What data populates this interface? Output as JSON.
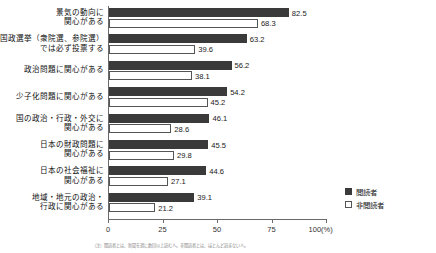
{
  "chart_data": {
    "type": "bar",
    "orientation": "horizontal",
    "title": "",
    "xlabel": "",
    "ylabel": "",
    "xlim": [
      0,
      100
    ],
    "xticks": [
      0,
      25,
      50,
      75,
      100
    ],
    "xtick_labels": [
      "0",
      "25",
      "50",
      "75",
      "100(%)"
    ],
    "grid": false,
    "legend_position": "bottom-right",
    "categories": [
      "景気の動向に\n関心がある",
      "国政選挙（衆院選、参院選）\nでは必ず投票する",
      "政治問題に関心がある",
      "少子化問題に関心がある",
      "国の政治・行政・外交に\n関心がある",
      "日本の財政問題に\n関心がある",
      "日本の社会福祉に\n関心がある",
      "地域・地元の政治・\n行政に関心がある"
    ],
    "series": [
      {
        "name": "閲読者",
        "color": "#3a3a3a",
        "values": [
          82.5,
          63.2,
          56.2,
          54.2,
          46.1,
          45.5,
          44.6,
          39.1
        ]
      },
      {
        "name": "非閲読者",
        "color": "#ffffff",
        "values": [
          68.3,
          39.6,
          38.1,
          45.2,
          28.6,
          29.8,
          27.1,
          21.2
        ]
      }
    ]
  },
  "rows": [
    {
      "label_line1": "景気の動向に",
      "label_line2": "関心がある",
      "reader": 82.5,
      "nonreader": 68.3,
      "reader_text": "82.5",
      "nonreader_text": "68.3"
    },
    {
      "label_line1": "国政選挙（衆院選、参院選）",
      "label_line2": "では必ず投票する",
      "reader": 63.2,
      "nonreader": 39.6,
      "reader_text": "63.2",
      "nonreader_text": "39.6"
    },
    {
      "label_line1": "政治問題に関心がある",
      "label_line2": "",
      "reader": 56.2,
      "nonreader": 38.1,
      "reader_text": "56.2",
      "nonreader_text": "38.1"
    },
    {
      "label_line1": "少子化問題に関心がある",
      "label_line2": "",
      "reader": 54.2,
      "nonreader": 45.2,
      "reader_text": "54.2",
      "nonreader_text": "45.2"
    },
    {
      "label_line1": "国の政治・行政・外交に",
      "label_line2": "関心がある",
      "reader": 46.1,
      "nonreader": 28.6,
      "reader_text": "46.1",
      "nonreader_text": "28.6"
    },
    {
      "label_line1": "日本の財政問題に",
      "label_line2": "関心がある",
      "reader": 45.5,
      "nonreader": 29.8,
      "reader_text": "45.5",
      "nonreader_text": "29.8"
    },
    {
      "label_line1": "日本の社会福祉に",
      "label_line2": "関心がある",
      "reader": 44.6,
      "nonreader": 27.1,
      "reader_text": "44.6",
      "nonreader_text": "27.1"
    },
    {
      "label_line1": "地域・地元の政治・",
      "label_line2": "行政に関心がある",
      "reader": 39.1,
      "nonreader": 21.2,
      "reader_text": "39.1",
      "nonreader_text": "21.2"
    }
  ],
  "axis": {
    "ticks": [
      {
        "value": 0,
        "label": "0"
      },
      {
        "value": 25,
        "label": "25"
      },
      {
        "value": 50,
        "label": "50"
      },
      {
        "value": 75,
        "label": "75"
      },
      {
        "value": 100,
        "label": "100(%)"
      }
    ]
  },
  "legend": {
    "items": [
      {
        "label": "閲読者",
        "type": "reader"
      },
      {
        "label": "非閲読者",
        "type": "nonreader"
      }
    ]
  },
  "footnote": {
    "text": "（注）閲読者とは、新聞を週に数回以上読む人。非閲読者とは、ほとんど読まない人。"
  },
  "colors": {
    "reader": "#3a3a3a",
    "nonreader": "#ffffff",
    "axis": "#6a6a6a",
    "text": "#1a1a1a"
  }
}
